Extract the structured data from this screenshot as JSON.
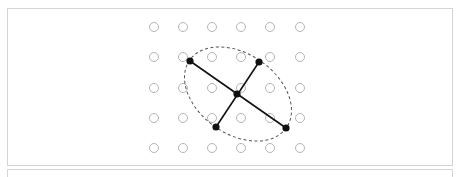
{
  "diagram": {
    "grid": {
      "cols_x": [
        154,
        183,
        212,
        241,
        270,
        300
      ],
      "rows_y": [
        27,
        57,
        88,
        118,
        148
      ],
      "dot_radius": 4.5,
      "dot_stroke": "#b5b5b5"
    },
    "ellipse": {
      "cx": 238,
      "cy": 94,
      "rx": 59,
      "ry": 40,
      "rotation_deg": 35,
      "stroke": "#555555",
      "dash": "3,2.5"
    },
    "center_point": {
      "x": 237,
      "y": 94
    },
    "major_axis": {
      "x1": 190,
      "y1": 61,
      "x2": 286,
      "y2": 128
    },
    "minor_axis": {
      "x1": 259,
      "y1": 62,
      "x2": 216,
      "y2": 127
    },
    "points": [
      {
        "x": 190,
        "y": 61
      },
      {
        "x": 259,
        "y": 62
      },
      {
        "x": 237,
        "y": 94
      },
      {
        "x": 216,
        "y": 127
      },
      {
        "x": 286,
        "y": 128
      }
    ],
    "line_color": "#111111"
  }
}
